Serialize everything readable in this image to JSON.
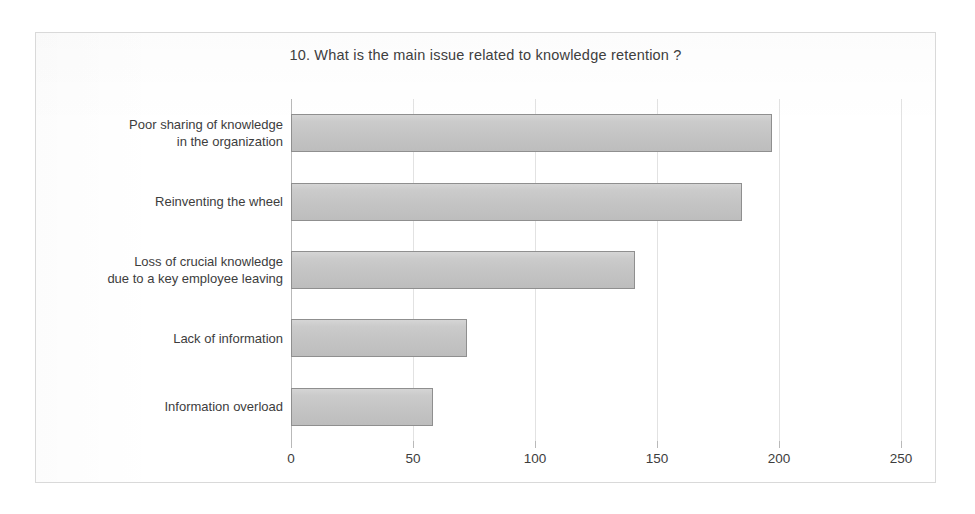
{
  "chart_data": {
    "type": "bar",
    "orientation": "horizontal",
    "title": "10. What is the main issue related  to knowledge  retention  ?",
    "xlabel": "",
    "ylabel": "",
    "xlim": [
      0,
      250
    ],
    "grid": true,
    "legend": "none",
    "categories": [
      "Poor sharing of knowledge\nin the organization",
      "Reinventing the wheel",
      "Loss of crucial knowledge\ndue to a key employee leaving",
      "Lack of information",
      "Information overload"
    ],
    "category_lines": [
      [
        "Poor sharing of knowledge",
        "in the organization"
      ],
      [
        "Reinventing the wheel"
      ],
      [
        "Loss of crucial knowledge",
        "due to a key employee leaving"
      ],
      [
        "Lack of information"
      ],
      [
        "Information overload"
      ]
    ],
    "values": [
      197,
      185,
      141,
      72,
      58
    ],
    "tick_labels": [
      "0",
      "50",
      "100",
      "150",
      "200",
      "250"
    ],
    "tick_values": [
      0,
      50,
      100,
      150,
      200,
      250
    ],
    "colors": {
      "bar_fill": "#c6c6c6",
      "bar_border": "#8f8f8f",
      "gridline": "#e2e2e2",
      "axis": "#b9b9b9",
      "text": "#3d3d3d",
      "frame": "#d9d9d9",
      "background": "#ffffff"
    }
  }
}
